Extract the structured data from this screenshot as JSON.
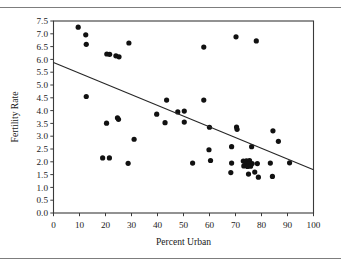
{
  "figure": {
    "ghost_caption": "",
    "has_top_rule": true,
    "has_bottom_rule": true
  },
  "chart_data": {
    "type": "scatter",
    "title": "",
    "xlabel": "Percent Urban",
    "ylabel": "Fertility Rate",
    "xlim": [
      0,
      100
    ],
    "ylim": [
      0.0,
      7.5
    ],
    "xticks": [
      0,
      10,
      20,
      30,
      40,
      50,
      60,
      70,
      80,
      90,
      100
    ],
    "xticklabels": [
      "0",
      "10",
      "20",
      "30",
      "40",
      "50",
      "60",
      "70",
      "80",
      "90",
      "100"
    ],
    "yticks": [
      0.0,
      0.5,
      1.0,
      1.5,
      2.0,
      2.5,
      3.0,
      3.5,
      4.0,
      4.5,
      5.0,
      5.5,
      6.0,
      6.5,
      7.0,
      7.5
    ],
    "yticklabels": [
      "0.0",
      "0.5",
      "1.0",
      "1.5",
      "2.0",
      "2.5",
      "3.0",
      "3.5",
      "4.0",
      "4.5",
      "5.0",
      "5.5",
      "6.0",
      "6.5",
      "7.0",
      "7.5"
    ],
    "grid": false,
    "legend": null,
    "marker_color": "#111111",
    "marker_size": 2.6,
    "trendline": {
      "type": "linear-fit",
      "color": "#262626",
      "x_start": 0,
      "y_start": 5.88,
      "x_end": 100,
      "y_end": 1.69
    },
    "points": [
      [
        9.5,
        7.26
      ],
      [
        12.4,
        6.96
      ],
      [
        12.6,
        6.59
      ],
      [
        20.5,
        6.21
      ],
      [
        21.6,
        6.2
      ],
      [
        24.0,
        6.14
      ],
      [
        25.2,
        6.1
      ],
      [
        29.0,
        6.64
      ],
      [
        57.8,
        6.48
      ],
      [
        70.2,
        6.88
      ],
      [
        78.0,
        6.72
      ],
      [
        12.6,
        4.55
      ],
      [
        43.5,
        4.41
      ],
      [
        57.8,
        4.41
      ],
      [
        47.8,
        3.95
      ],
      [
        50.3,
        3.98
      ],
      [
        39.7,
        3.86
      ],
      [
        24.6,
        3.72
      ],
      [
        25.0,
        3.66
      ],
      [
        20.4,
        3.51
      ],
      [
        42.9,
        3.53
      ],
      [
        50.3,
        3.55
      ],
      [
        60.0,
        3.35
      ],
      [
        70.4,
        3.36
      ],
      [
        70.6,
        3.27
      ],
      [
        84.4,
        3.21
      ],
      [
        86.5,
        2.8
      ],
      [
        31.0,
        2.88
      ],
      [
        59.8,
        2.47
      ],
      [
        68.5,
        2.59
      ],
      [
        76.2,
        2.59
      ],
      [
        18.9,
        2.15
      ],
      [
        21.5,
        2.15
      ],
      [
        60.4,
        2.05
      ],
      [
        53.5,
        1.95
      ],
      [
        68.5,
        1.95
      ],
      [
        73.0,
        2.03
      ],
      [
        74.2,
        2.04
      ],
      [
        75.4,
        2.05
      ],
      [
        74.0,
        1.93
      ],
      [
        75.2,
        1.92
      ],
      [
        76.4,
        1.93
      ],
      [
        78.4,
        1.93
      ],
      [
        73.2,
        1.84
      ],
      [
        74.6,
        1.82
      ],
      [
        75.8,
        1.83
      ],
      [
        83.4,
        1.95
      ],
      [
        90.8,
        1.96
      ],
      [
        68.2,
        1.58
      ],
      [
        77.4,
        1.6
      ],
      [
        75.0,
        1.52
      ],
      [
        78.8,
        1.4
      ],
      [
        84.2,
        1.43
      ],
      [
        28.7,
        1.94
      ]
    ]
  }
}
